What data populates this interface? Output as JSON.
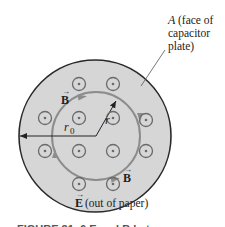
{
  "figure": {
    "plate_label": {
      "symbol": "A",
      "line1": "(face of",
      "line2": "capacitor",
      "line3": "plate)"
    },
    "field_labels": {
      "b_top": "B",
      "b_bottom": "B",
      "e_symbol": "E",
      "e_note": "(out of paper)"
    },
    "radius_labels": {
      "r": "r",
      "r0_base": "r",
      "r0_sub": "0"
    },
    "caption_partial": "FIGURE 31–6  E and B between",
    "colors": {
      "plate_fill": "#d6d6d6",
      "plate_edge": "#2a2a2a",
      "loop": "#8c8c8c",
      "dot_symbol": "#6a6a6a",
      "text": "#222222"
    },
    "e_field_dots": [
      {
        "x": 79,
        "y": 84
      },
      {
        "x": 113,
        "y": 84
      },
      {
        "x": 45,
        "y": 118
      },
      {
        "x": 79,
        "y": 118
      },
      {
        "x": 113,
        "y": 118
      },
      {
        "x": 146,
        "y": 120
      },
      {
        "x": 45,
        "y": 151
      },
      {
        "x": 79,
        "y": 151
      },
      {
        "x": 113,
        "y": 151
      },
      {
        "x": 146,
        "y": 151
      },
      {
        "x": 79,
        "y": 184
      },
      {
        "x": 113,
        "y": 184
      }
    ]
  }
}
